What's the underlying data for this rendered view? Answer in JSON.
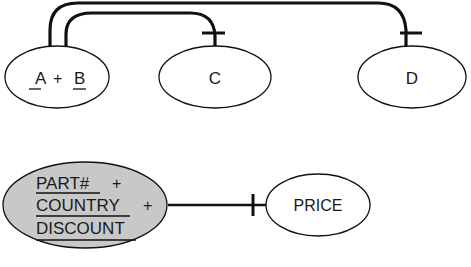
{
  "diagram": {
    "type": "functional-dependency-diagram",
    "top": {
      "nodes": [
        {
          "id": "ab",
          "parts": [
            "A",
            "+",
            "B"
          ],
          "underlined": [
            "A",
            "B"
          ]
        },
        {
          "id": "c",
          "label": "C"
        },
        {
          "id": "d",
          "label": "D"
        }
      ],
      "edges": [
        {
          "from": "ab",
          "to": "c",
          "end": "bar"
        },
        {
          "from": "ab",
          "to": "d",
          "end": "bar"
        }
      ]
    },
    "bottom": {
      "nodes": [
        {
          "id": "key",
          "lines": [
            "PART# +",
            "COUNTRY +",
            "DISCOUNT"
          ],
          "parts": [
            "PART#",
            "+",
            "COUNTRY",
            "+",
            "DISCOUNT"
          ],
          "shaded": true,
          "fill": "#c8c8c8"
        },
        {
          "id": "price",
          "label": "PRICE"
        }
      ],
      "edges": [
        {
          "from": "key",
          "to": "price",
          "end": "bar"
        }
      ]
    },
    "colors": {
      "stroke": "#111111",
      "shade": "#c8c8c8",
      "background": "#ffffff"
    }
  }
}
